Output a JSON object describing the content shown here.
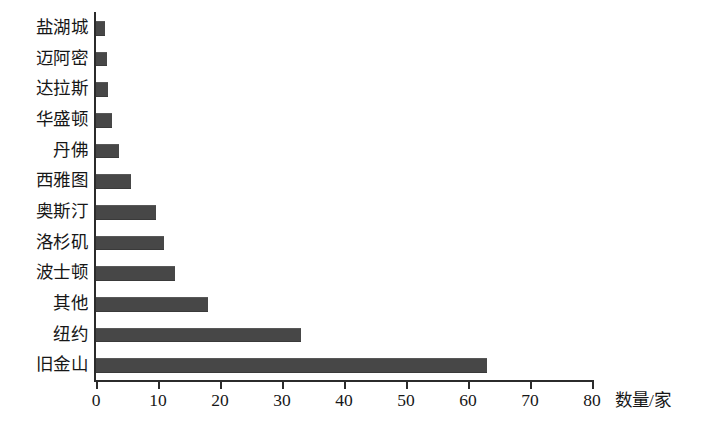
{
  "chart_data": {
    "type": "bar",
    "orientation": "horizontal",
    "title": "",
    "xlabel": "数量/家",
    "ylabel": "",
    "xlim": [
      0,
      80
    ],
    "xticks": [
      0,
      10,
      20,
      30,
      40,
      50,
      60,
      70,
      80
    ],
    "grid": false,
    "legend": null,
    "bar_color": "#474747",
    "background_color": "#ffffff",
    "axis_color": "#2b2b2b",
    "categories": [
      "盐湖城",
      "迈阿密",
      "达拉斯",
      "华盛顿",
      "丹佛",
      "西雅图",
      "奥斯汀",
      "洛杉矶",
      "波士顿",
      "其他",
      "纽约",
      "旧金山"
    ],
    "values": [
      1.5,
      1.7,
      1.9,
      2.6,
      3.7,
      5.6,
      9.7,
      11.0,
      12.7,
      18.0,
      33.0,
      63.0
    ]
  }
}
